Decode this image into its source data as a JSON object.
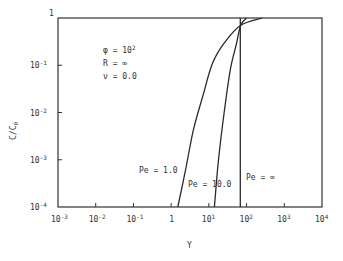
{
  "chart_data": {
    "type": "line",
    "title": "",
    "xlabel": "Y",
    "ylabel": "C/C0",
    "xscale": "log",
    "yscale": "log",
    "xlim": [
      0.001,
      10000
    ],
    "ylim": [
      0.0001,
      1
    ],
    "grid": false,
    "x_ticks": [
      {
        "base": "10",
        "exp": "-3",
        "value": 0.001
      },
      {
        "base": "10",
        "exp": "-2",
        "value": 0.01
      },
      {
        "base": "10",
        "exp": "-1",
        "value": 0.1
      },
      {
        "base": "1",
        "exp": "",
        "value": 1
      },
      {
        "base": "10",
        "exp": "1",
        "value": 10
      },
      {
        "base": "10",
        "exp": "2",
        "value": 100
      },
      {
        "base": "10",
        "exp": "3",
        "value": 1000
      },
      {
        "base": "10",
        "exp": "4",
        "value": 10000
      }
    ],
    "y_ticks": [
      {
        "base": "1",
        "exp": "",
        "value": 1
      },
      {
        "base": "10",
        "exp": "-1",
        "value": 0.1
      },
      {
        "base": "10",
        "exp": "-2",
        "value": 0.01
      },
      {
        "base": "10",
        "exp": "-3",
        "value": 0.001
      },
      {
        "base": "10",
        "exp": "-4",
        "value": 0.0001
      }
    ],
    "annotations": {
      "params": [
        {
          "symbol": "φ",
          "eq": "=",
          "value": "10",
          "exp": "2"
        },
        {
          "symbol": "R",
          "eq": "=",
          "value": "∞",
          "exp": ""
        },
        {
          "symbol": "ν",
          "eq": "=",
          "value": "0.0",
          "exp": ""
        }
      ]
    },
    "series": [
      {
        "name": "Pe = 1.0",
        "label": "Pe = 1.0",
        "x": [
          1.5,
          2.4,
          3.9,
          7.0,
          12.5,
          26,
          70,
          260
        ],
        "y": [
          0.0001,
          0.0006,
          0.0043,
          0.023,
          0.11,
          0.3,
          0.7,
          1.0
        ]
      },
      {
        "name": "Pe = 10.0",
        "label": "Pe = 10.0",
        "x": [
          14,
          18,
          26,
          37,
          53,
          70,
          100
        ],
        "y": [
          0.0001,
          0.001,
          0.0113,
          0.08,
          0.27,
          0.7,
          1.0
        ]
      },
      {
        "name": "Pe = ∞",
        "label": "Pe = ∞",
        "x": [
          68,
          68
        ],
        "y": [
          0.0001,
          1.0
        ]
      }
    ]
  },
  "labels": {
    "x_axis": "Y",
    "y_axis_main": "C/C",
    "y_axis_sub": "0",
    "curve_pe1": "Pe = 1.0",
    "curve_pe10": "Pe = 10.0",
    "curve_peinf": "Pe = ∞"
  }
}
